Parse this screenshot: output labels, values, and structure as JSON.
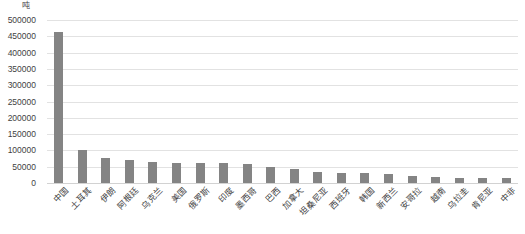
{
  "chart_data": {
    "type": "bar",
    "title": "",
    "subtitle": "",
    "xlabel": "",
    "ylabel": "吨",
    "unit_label": "吨",
    "ylim": [
      0,
      500000
    ],
    "ytick_step": 50000,
    "yticks": [
      "500000",
      "450000",
      "400000",
      "350000",
      "300000",
      "250000",
      "200000",
      "150000",
      "100000",
      "50000",
      "0"
    ],
    "ytick_values": [
      500000,
      450000,
      400000,
      350000,
      300000,
      250000,
      200000,
      150000,
      100000,
      50000,
      0
    ],
    "grid": true,
    "grid_axis": "y",
    "legend": false,
    "legend_position": "none",
    "bar_color": "#848484",
    "grid_color": "#e2e2e2",
    "text_color": "#3f3f3f",
    "background_color": "#ffffff",
    "categories": [
      "中国",
      "土耳其",
      "伊朗",
      "阿根廷",
      "乌克兰",
      "美国",
      "俄罗斯",
      "印度",
      "墨西哥",
      "巴西",
      "加拿大",
      "坦桑尼亚",
      "西班牙",
      "韩国",
      "新西兰",
      "安哥拉",
      "越南",
      "乌拉圭",
      "肯尼亚",
      "中非"
    ],
    "values": [
      462000,
      101000,
      78000,
      72000,
      64000,
      62000,
      61000,
      60000,
      57000,
      48000,
      43000,
      35000,
      30000,
      30000,
      29000,
      22000,
      18000,
      16000,
      15000,
      14000
    ]
  }
}
